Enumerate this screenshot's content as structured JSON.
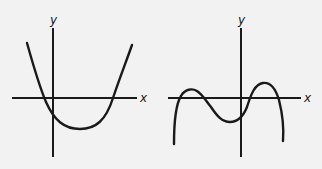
{
  "figure": {
    "background": "#f2f2f2",
    "ink": "#1a1a1a",
    "left_graph": {
      "x_label": "x",
      "y_label": "y",
      "description": "upward-opening parabola with two x-intercepts, negative y-intercept"
    },
    "right_graph": {
      "x_label": "x",
      "y_label": "y",
      "description": "quartic-like curve with two local maxima above x-axis, local minimum below, ends pointing down"
    }
  }
}
